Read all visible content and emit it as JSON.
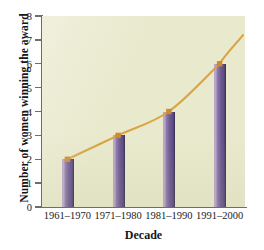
{
  "chart_data": {
    "type": "bar",
    "title": "",
    "subtitle": "",
    "xlabel": "Decade",
    "ylabel": "Number of women winning the award",
    "categories": [
      "1961–1970",
      "1971–1980",
      "1981–1990",
      "1991–2000"
    ],
    "values": [
      2,
      3,
      4,
      6
    ],
    "series": [
      {
        "name": "Number of women winning the award",
        "type": "bar",
        "values": [
          2,
          3,
          4,
          6
        ]
      },
      {
        "name": "trend",
        "type": "line",
        "values": [
          2,
          3,
          4,
          6
        ],
        "marker": "square",
        "extends_beyond_last_point": true
      }
    ],
    "ylim": [
      0,
      8
    ],
    "ytick_labels": [
      "0",
      "1",
      "2",
      "3",
      "4",
      "5",
      "6",
      "7",
      "8"
    ],
    "ytick_values": [
      0,
      1,
      2,
      3,
      4,
      5,
      6,
      7,
      8
    ],
    "grid": false,
    "legend": false,
    "legend_position": "none",
    "colors": {
      "plot_background": "#e9e9cd",
      "page_background": "#ffffff",
      "bar_light": "#b9a7c9",
      "bar_dark": "#4e3f6e",
      "bar_outline": "#3f3359",
      "line": "#d9a441",
      "marker": "#d08a2e",
      "axis": "#6d6d6d",
      "text": "#1b1b1b"
    }
  }
}
